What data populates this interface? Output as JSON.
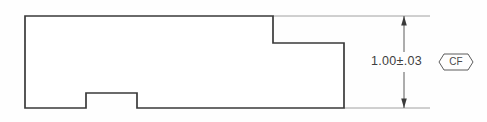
{
  "drawing": {
    "title": "Stepped block profile with bottom notch",
    "background_color": "#fefefe",
    "outline_color": "#3a3a3a",
    "annotation_color": "#4a4a4a",
    "extension_line_color": "#8c8c8c",
    "part": {
      "name": "stepped-block-profile",
      "path": "M 25 16 L 273 16 L 273 43 L 344 43 L 344 108 L 137 108 L 137 93 L 86 93 L 86 108 L 25 108 Z",
      "features": [
        "top-left-flange",
        "right-step-down",
        "bottom-center-notch"
      ]
    },
    "extension_lines": [
      {
        "name": "top-extension-line",
        "x1": 273,
        "y1": 16,
        "x2": 430,
        "y2": 16
      },
      {
        "name": "bottom-extension-line",
        "x1": 344,
        "y1": 108,
        "x2": 430,
        "y2": 108
      }
    ],
    "dimension": {
      "name": "overall-height-dimension",
      "orientation": "vertical",
      "x": 404,
      "y_top": 16,
      "y_bottom": 108,
      "nominal": "1.00",
      "tolerance_symbol": "±",
      "tolerance": ".03",
      "label": "1.00±.03",
      "text_x": 371,
      "text_y": 62,
      "text_gap_top": 52,
      "text_gap_bottom": 72
    },
    "callout": {
      "name": "cf-callout-symbol",
      "label": "CF",
      "meaning": "feature-control-callout",
      "shape": "elongated-hexagon",
      "center_x": 456,
      "center_y": 62,
      "half_width": 17,
      "half_height": 8,
      "chamfer": 5
    }
  }
}
